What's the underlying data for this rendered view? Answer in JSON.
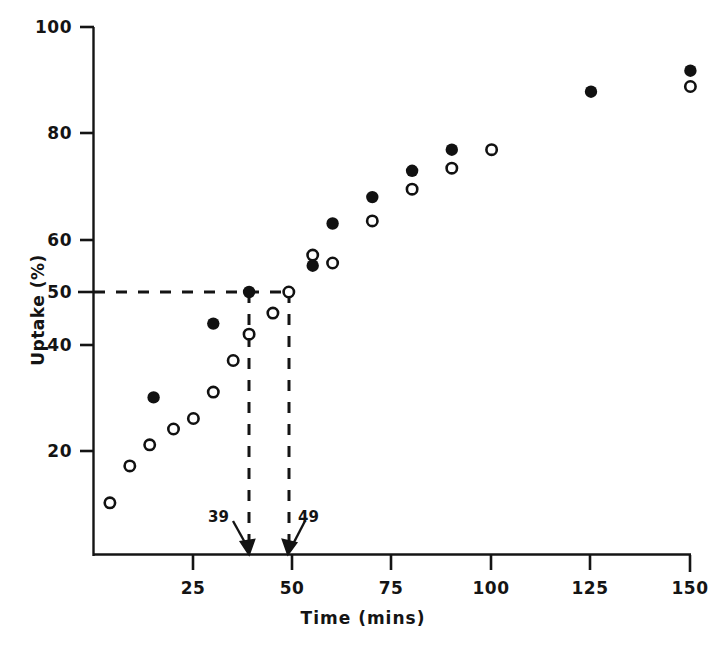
{
  "chart_data": {
    "type": "scatter",
    "title": "",
    "xlabel": "Time (mins)",
    "ylabel": "Uptake (%)",
    "xlim": [
      0,
      158
    ],
    "ylim": [
      0,
      100
    ],
    "grid": false,
    "legend_position": "none",
    "xticks": [
      25,
      50,
      75,
      100,
      125,
      150
    ],
    "xtick_labels": [
      "25",
      "50",
      "75",
      "100",
      "125",
      "150"
    ],
    "yticks": [
      20,
      40,
      50,
      60,
      80,
      100
    ],
    "ytick_labels": [
      "20",
      "40",
      "50",
      "60",
      "80",
      "100"
    ],
    "series": [
      {
        "name": "filled-circles",
        "marker": "filled-circle",
        "color": "#111111",
        "points": [
          {
            "x": 15,
            "y": 30
          },
          {
            "x": 30,
            "y": 44
          },
          {
            "x": 39,
            "y": 50
          },
          {
            "x": 55,
            "y": 55
          },
          {
            "x": 60,
            "y": 63
          },
          {
            "x": 70,
            "y": 68
          },
          {
            "x": 80,
            "y": 73
          },
          {
            "x": 90,
            "y": 77
          },
          {
            "x": 125,
            "y": 88
          },
          {
            "x": 150,
            "y": 92
          }
        ]
      },
      {
        "name": "open-circles",
        "marker": "open-circle",
        "color": "#111111",
        "points": [
          {
            "x": 4,
            "y": 10
          },
          {
            "x": 9,
            "y": 17
          },
          {
            "x": 14,
            "y": 21
          },
          {
            "x": 20,
            "y": 24
          },
          {
            "x": 25,
            "y": 26
          },
          {
            "x": 30,
            "y": 31
          },
          {
            "x": 35,
            "y": 37
          },
          {
            "x": 39,
            "y": 42
          },
          {
            "x": 45,
            "y": 46
          },
          {
            "x": 49,
            "y": 50
          },
          {
            "x": 55,
            "y": 57
          },
          {
            "x": 60,
            "y": 55.5
          },
          {
            "x": 70,
            "y": 63.5
          },
          {
            "x": 80,
            "y": 69.5
          },
          {
            "x": 90,
            "y": 73.5
          },
          {
            "x": 100,
            "y": 77
          },
          {
            "x": 150,
            "y": 89
          }
        ]
      }
    ],
    "reference_lines": [
      {
        "name": "half-uptake-horizontal",
        "orientation": "horizontal",
        "value": 50,
        "style": "dashed"
      },
      {
        "name": "t-half-filled-vertical",
        "orientation": "vertical",
        "value": 39,
        "style": "dashed"
      },
      {
        "name": "t-half-open-vertical",
        "orientation": "vertical",
        "value": 49,
        "style": "dashed"
      }
    ],
    "annotations": [
      {
        "name": "annotation-39",
        "text": "39",
        "x": 39,
        "points_to": "x-axis"
      },
      {
        "name": "annotation-49",
        "text": "49",
        "x": 49,
        "points_to": "x-axis"
      }
    ]
  }
}
